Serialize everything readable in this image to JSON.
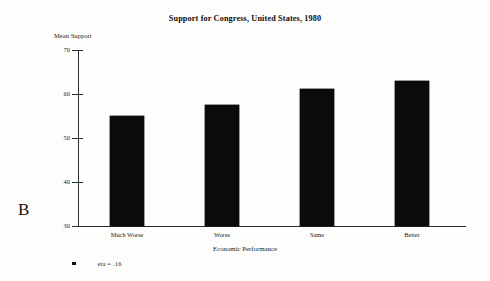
{
  "panel": {
    "letter": "B"
  },
  "footnote": {
    "marker": "square-bullet",
    "text": "eta = .16"
  },
  "chart_data": {
    "type": "bar",
    "title": "Support for Congress, United States, 1980",
    "xlabel": "Economic Performance",
    "ylabel": "Mean Support",
    "categories": [
      "Much Worse",
      "Worse",
      "Same",
      "Better"
    ],
    "values": [
      55,
      57.5,
      61.2,
      63
    ],
    "ylim": [
      30,
      70
    ],
    "yticks": [
      30,
      40,
      50,
      60,
      70
    ],
    "ytick_labels": [
      "30",
      "40",
      "50",
      "60",
      "70"
    ],
    "grid": false,
    "legend": null,
    "bar_color": "#0b0b0b",
    "annotations": [
      "eta = .16"
    ]
  }
}
